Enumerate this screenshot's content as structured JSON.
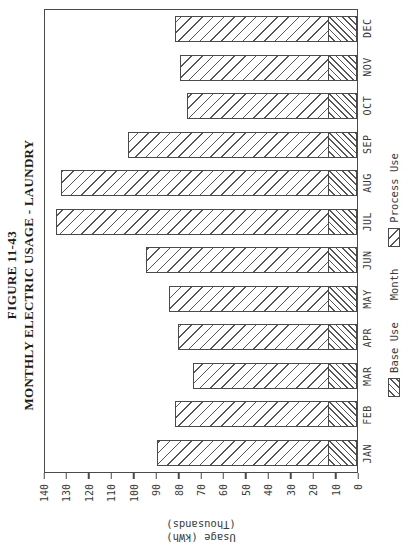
{
  "title": {
    "line1": "FIGURE 11-43",
    "line2": "MONTHLY ELECTRIC USAGE - LAUNDRY"
  },
  "y_axis": {
    "title_line1": "Usage (kWh)",
    "title_line2": "(Thousands)",
    "ticks": [
      0,
      10,
      20,
      30,
      40,
      50,
      60,
      70,
      80,
      90,
      100,
      110,
      120,
      130,
      140
    ],
    "max": 140
  },
  "x_axis": {
    "title": "Month"
  },
  "legend": {
    "base_label": "Base Use",
    "process_label": "Process Use",
    "position": "bottom"
  },
  "colors": {
    "ink": "#3a3a3a",
    "frame": "#4a4a4a",
    "hatch": "#565656",
    "background": "#ffffff"
  },
  "orientation": "landscape chart rotated 90 degrees counterclockwise on portrait page",
  "chart_data": {
    "type": "bar",
    "stacked": true,
    "title": "MONTHLY ELECTRIC USAGE - LAUNDRY",
    "xlabel": "Month",
    "ylabel": "Usage (kWh) (Thousands)",
    "ylim": [
      0,
      140
    ],
    "grid": false,
    "legend_position": "bottom",
    "categories": [
      "JAN",
      "FEB",
      "MAR",
      "APR",
      "MAY",
      "JUN",
      "JUL",
      "AUG",
      "SEP",
      "OCT",
      "NOV",
      "DEC"
    ],
    "series": [
      {
        "name": "Base Use",
        "hatch": "fine-diagonal",
        "values": [
          13,
          13,
          13,
          13,
          13,
          13,
          13,
          13,
          13,
          13,
          13,
          13
        ]
      },
      {
        "name": "Process Use",
        "hatch": "wide-diagonal",
        "values": [
          76,
          68,
          60,
          67,
          71,
          81,
          121,
          119,
          89,
          63,
          66,
          68
        ]
      }
    ],
    "totals": [
      89,
      81,
      73,
      80,
      84,
      94,
      134,
      132,
      102,
      76,
      79,
      81
    ]
  }
}
